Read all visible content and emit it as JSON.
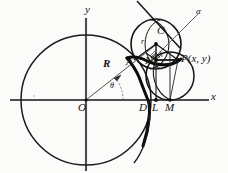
{
  "figure": {
    "kind": "geometry-diagram",
    "colors": {
      "ink": "#141414",
      "axis": "#4d4d4d",
      "paper": "#fbfbfa",
      "thin_curve": "#1a1a1a",
      "thick_curve": "#0d0d0d"
    },
    "labels": {
      "y_axis": "y",
      "x_axis": "x",
      "origin": "O",
      "center_C": "C",
      "point_N": "N",
      "point_A": "A",
      "point_D": "D",
      "point_L": "L",
      "point_M": "M",
      "point_P": "P(x, y)",
      "radius_r": "r",
      "radius_R": "R",
      "angle_theta": "θ",
      "line_alpha": "α",
      "angle_phi": "φ"
    },
    "geometry": {
      "origin": {
        "x": 86,
        "y": 100
      },
      "big_circle": {
        "cx": 86,
        "cy": 100,
        "r": 65
      },
      "rolling_circle": {
        "cx": 156,
        "cy": 44,
        "r": 25
      },
      "small_circle": {
        "cx": 170,
        "cy": 76,
        "r": 24
      },
      "point_A": {
        "x": 134,
        "y": 70
      },
      "point_D": {
        "x": 148,
        "y": 100
      },
      "point_L": {
        "x": 156,
        "y": 100
      },
      "point_M": {
        "x": 170,
        "y": 100
      },
      "point_N": {
        "x": 156,
        "y": 60
      },
      "point_P": {
        "x": 178,
        "y": 60
      },
      "point_C": {
        "x": 156,
        "y": 44
      },
      "theta_degrees": 38,
      "alpha_line": {
        "x1": 150,
        "y1": 60,
        "x2": 200,
        "y2": 18
      },
      "tangent_line": {
        "x1": 137,
        "y1": 2,
        "x2": 176,
        "y2": 44
      }
    },
    "label_positions": {
      "y_axis": {
        "left": 85,
        "top": 4
      },
      "x_axis": {
        "left": 211,
        "top": 91
      },
      "origin": {
        "left": 79,
        "top": 101
      },
      "center_C": {
        "left": 157,
        "top": 26
      },
      "point_N": {
        "left": 146,
        "top": 56
      },
      "point_A": {
        "left": 126,
        "top": 57
      },
      "point_D": {
        "left": 140,
        "top": 103
      },
      "point_L": {
        "left": 153,
        "top": 103
      },
      "point_M": {
        "left": 166,
        "top": 103
      },
      "point_P": {
        "left": 180,
        "top": 54
      },
      "radius_r": {
        "left": 142,
        "top": 39
      },
      "radius_R": {
        "left": 104,
        "top": 59
      },
      "angle_theta": {
        "left": 111,
        "top": 83
      },
      "line_alpha": {
        "left": 196,
        "top": 8
      }
    }
  }
}
